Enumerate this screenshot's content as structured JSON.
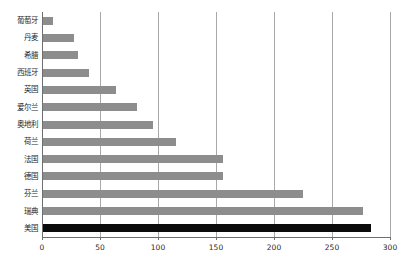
{
  "chart_data": {
    "type": "bar",
    "orientation": "horizontal",
    "title": "",
    "xlabel": "",
    "ylabel": "",
    "xlim": [
      0,
      300
    ],
    "xticks": [
      0,
      50,
      100,
      150,
      200,
      250,
      300
    ],
    "grid": true,
    "legend": "none",
    "categories": [
      "葡萄牙",
      "丹麦",
      "希腊",
      "西班牙",
      "英国",
      "爱尔兰",
      "奥地利",
      "荷兰",
      "法国",
      "德国",
      "芬兰",
      "瑞典",
      "美国"
    ],
    "values": [
      9,
      27,
      30,
      40,
      63,
      81,
      95,
      115,
      155,
      155,
      224,
      276,
      283
    ],
    "colors": {
      "bar_default": "#8d8d8d",
      "bar_highlight": "#0b0b0b",
      "axis": "#6f6f6f",
      "gridline": "#a8a8a8",
      "text": "#1f1f1f",
      "background": "#ffffff"
    },
    "highlight_category": "美国",
    "bars": [
      {
        "label": "葡萄牙",
        "value": 9,
        "highlight": false
      },
      {
        "label": "丹麦",
        "value": 27,
        "highlight": false
      },
      {
        "label": "希腊",
        "value": 30,
        "highlight": false
      },
      {
        "label": "西班牙",
        "value": 40,
        "highlight": false
      },
      {
        "label": "英国",
        "value": 63,
        "highlight": false
      },
      {
        "label": "爱尔兰",
        "value": 81,
        "highlight": false
      },
      {
        "label": "奥地利",
        "value": 95,
        "highlight": false
      },
      {
        "label": "荷兰",
        "value": 115,
        "highlight": false
      },
      {
        "label": "法国",
        "value": 155,
        "highlight": false
      },
      {
        "label": "德国",
        "value": 155,
        "highlight": false
      },
      {
        "label": "芬兰",
        "value": 224,
        "highlight": false
      },
      {
        "label": "瑞典",
        "value": 276,
        "highlight": false
      },
      {
        "label": "美国",
        "value": 283,
        "highlight": true
      }
    ]
  }
}
